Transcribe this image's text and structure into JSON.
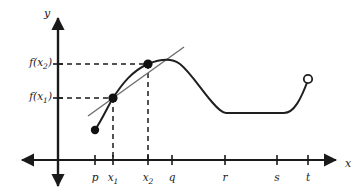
{
  "figure": {
    "background_color": "#ffffff",
    "curve_color": "#1f1f1f",
    "secant_color": "#6e6e6e",
    "dash_color": "#1a1a1a",
    "axis_color": "#1a1a1a"
  },
  "axes": {
    "x_label": "x",
    "y_label": "y",
    "origin": {
      "x": 58,
      "y": 160
    },
    "x_axis_arrows": [
      "left",
      "right"
    ],
    "y_axis_arrows": [
      "up",
      "down"
    ]
  },
  "x_ticks": [
    {
      "label": "p",
      "sub": "",
      "x": 95
    },
    {
      "label": "x",
      "sub": "1",
      "x": 113
    },
    {
      "label": "x",
      "sub": "2",
      "x": 148
    },
    {
      "label": "q",
      "sub": "",
      "x": 172
    },
    {
      "label": "r",
      "sub": "",
      "x": 225
    },
    {
      "label": "s",
      "sub": "",
      "x": 277
    },
    {
      "label": "t",
      "sub": "",
      "x": 308
    }
  ],
  "y_values": [
    {
      "label": "f(x",
      "sub": "2",
      "close": ")",
      "y": 64
    },
    {
      "label": "f(x",
      "sub": "1",
      "close": ")",
      "y": 98
    }
  ],
  "points": [
    {
      "name": "curve-start-point",
      "kind": "filled",
      "x": 95,
      "y": 130
    },
    {
      "name": "point-x1",
      "kind": "filled",
      "x": 113,
      "y": 98
    },
    {
      "name": "point-x2",
      "kind": "filled",
      "x": 148,
      "y": 64
    },
    {
      "name": "curve-end-point",
      "kind": "open",
      "x": 308,
      "y": 79
    }
  ],
  "chart_data": {
    "type": "line",
    "title": "",
    "xlabel": "x",
    "ylabel": "y",
    "grid": false,
    "legend": null,
    "x_tick_labels": [
      "p",
      "x₁",
      "x₂",
      "q",
      "r",
      "s",
      "t"
    ],
    "y_tick_labels": [
      "f(x₁)",
      "f(x₂)"
    ],
    "annotations": [
      "secant line drawn through (x₁, f(x₁)) and (x₂, f(x₂))",
      "dashed guide lines from y-axis to each marked point",
      "dashed guide lines from x-axis to each marked point",
      "closed dot at left end of curve (x = p)",
      "open dot at right end of curve (x = t)"
    ],
    "series": [
      {
        "name": "f(x)",
        "points": [
          [
            95,
            130
          ],
          [
            99,
            121
          ],
          [
            104,
            110
          ],
          [
            109,
            102
          ],
          [
            113,
            98
          ],
          [
            120,
            88
          ],
          [
            128,
            78
          ],
          [
            137,
            70
          ],
          [
            148,
            64
          ],
          [
            158,
            60
          ],
          [
            168,
            58
          ],
          [
            178,
            60
          ],
          [
            188,
            68
          ],
          [
            200,
            84
          ],
          [
            212,
            100
          ],
          [
            220,
            110
          ],
          [
            225,
            113
          ],
          [
            240,
            113
          ],
          [
            260,
            113
          ],
          [
            275,
            113
          ],
          [
            285,
            112
          ],
          [
            293,
            107
          ],
          [
            300,
            97
          ],
          [
            305,
            87
          ],
          [
            308,
            79
          ]
        ]
      },
      {
        "name": "secant-line",
        "points": [
          [
            88,
            116
          ],
          [
            183,
            48
          ]
        ]
      }
    ]
  }
}
